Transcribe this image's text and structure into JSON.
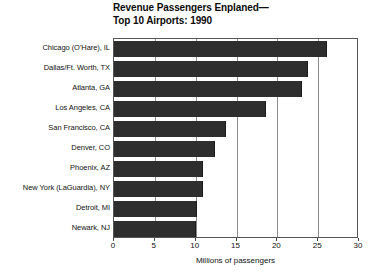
{
  "chart_data": {
    "type": "bar",
    "orientation": "horizontal",
    "title": "Revenue Passengers Enplaned— Top 10 Airports: 1990",
    "title_lines": [
      "Revenue Passengers Enplaned—",
      "Top 10 Airports:  1990"
    ],
    "categories": [
      "Chicago (O'Hare), IL",
      "Dallas/Ft. Worth, TX",
      "Atlanta, GA",
      "Los Angeles, CA",
      "San Francisco, CA",
      "Denver, CO",
      "Phoenix, AZ",
      "New York (LaGuardia), NY",
      "Detroit, MI",
      "Newark, NJ"
    ],
    "values": [
      26.1,
      23.7,
      23.0,
      18.6,
      13.7,
      12.4,
      10.9,
      10.9,
      10.2,
      10.0
    ],
    "xlabel": "Millions of passengers",
    "ylabel": "",
    "xlim": [
      0,
      30
    ],
    "xticks": [
      0,
      5,
      10,
      15,
      20,
      25,
      30
    ],
    "xtick_labels": [
      "0",
      "5",
      "10",
      "15",
      "20",
      "25",
      "30"
    ],
    "grid": true,
    "grid_axis": "x",
    "legend": false,
    "bar_color": "#2e2e2e",
    "frame_color": "#555555",
    "gridline_color": "#8d8d8d"
  }
}
